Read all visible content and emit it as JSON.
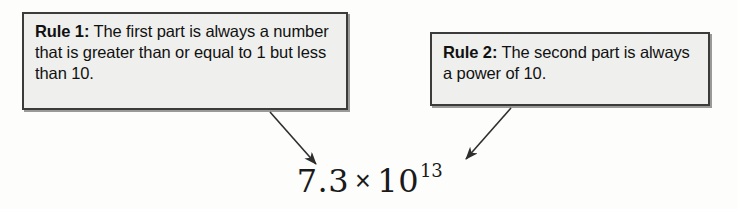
{
  "figure": {
    "background_color": "#fdfdfc",
    "box_fill_color": "#efefed",
    "box_border_color": "#3b3b3b",
    "arrow_color": "#2e2e2e",
    "text_color": "#111111"
  },
  "callouts": [
    {
      "id": "rule-1",
      "label": "Rule 1:",
      "text": " The first part is always a number that is greater than or equal to 1 but less than 10."
    },
    {
      "id": "rule-2",
      "label": "Rule 2:",
      "text": " The second part is always a power of 10."
    }
  ],
  "arrows": [
    {
      "id": "arrow-rule-1-to-mantissa",
      "from_callout": "rule-1",
      "points_to": "mantissa"
    },
    {
      "id": "arrow-rule-2-to-power",
      "from_callout": "rule-2",
      "points_to": "power-of-ten"
    }
  ],
  "formula": {
    "full_text": "7.3 × 10¹³",
    "mantissa": "7.3",
    "operator": "×",
    "base": "10",
    "exponent": "13"
  }
}
